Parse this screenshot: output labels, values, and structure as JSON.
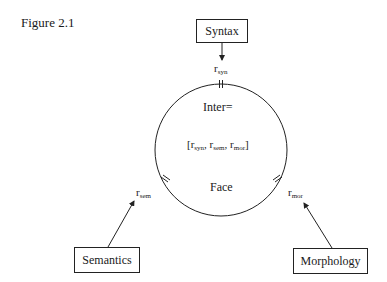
{
  "figure": {
    "title": "Figure 2.1"
  },
  "boxes": {
    "syntax": "Syntax",
    "semantics": "Semantics",
    "morphology": "Morphology"
  },
  "circle": {
    "top_label": "Inter=",
    "middle_label_open": "[",
    "middle_label_close": "]",
    "bottom_label": "Face"
  },
  "relations": {
    "syn": {
      "base": "r",
      "sub": "syn"
    },
    "sem": {
      "base": "r",
      "sub": "sem"
    },
    "mor": {
      "base": "r",
      "sub": "mor"
    }
  },
  "colors": {
    "line": "#222222",
    "background": "#ffffff"
  }
}
